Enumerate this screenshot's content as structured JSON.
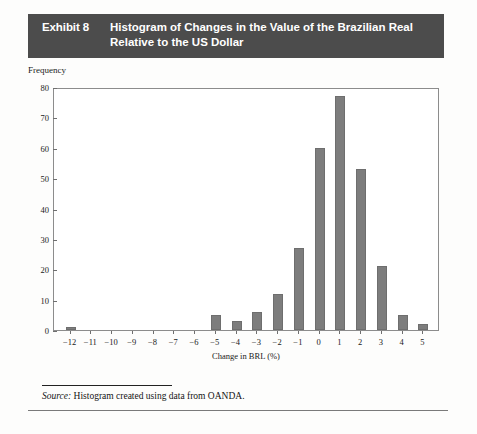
{
  "exhibit": {
    "number_label": "Exhibit 8",
    "title": "Histogram of Changes in the Value of the Brazilian Real Relative to the US Dollar",
    "title_line1": "Histogram of Changes in the Value of the Brazilian Real",
    "title_line2": "Relative to the US Dollar",
    "banner_color": "#4c4c4c",
    "banner_text_color": "#ffffff"
  },
  "source": {
    "label": "Source:",
    "text": "Histogram created using data from OANDA."
  },
  "chart_data": {
    "type": "bar",
    "title": "Histogram of Changes in the Value of the Brazilian Real Relative to the US Dollar",
    "subtitle": "",
    "xlabel": "Change in BRL (%)",
    "ylabel": "Frequency",
    "categories": [
      "-12",
      "-11",
      "-10",
      "-9",
      "-8",
      "-7",
      "-6",
      "-5",
      "-4",
      "-3",
      "-2",
      "-1",
      "0",
      "1",
      "2",
      "3",
      "4",
      "5"
    ],
    "values": [
      1,
      0,
      0,
      0,
      0,
      0,
      0,
      5,
      3,
      6,
      12,
      27,
      60,
      77,
      53,
      21,
      5,
      2
    ],
    "xlim": [
      -12.8,
      5.8
    ],
    "ylim": [
      0,
      80
    ],
    "ytick_labels": [
      "80",
      "70",
      "60",
      "50",
      "40",
      "30",
      "20",
      "10",
      "0"
    ],
    "ytick_values": [
      80,
      70,
      60,
      50,
      40,
      30,
      20,
      10,
      0
    ],
    "xtick_labels": [
      "−12",
      "−11",
      "−10",
      "−9",
      "−8",
      "−7",
      "−6",
      "−5",
      "−4",
      "−3",
      "−2",
      "−1",
      "0",
      "1",
      "2",
      "3",
      "4",
      "5"
    ],
    "xtick_values": [
      -12,
      -11,
      -10,
      -9,
      -8,
      -7,
      -6,
      -5,
      -4,
      -3,
      -2,
      -1,
      0,
      1,
      2,
      3,
      4,
      5
    ],
    "grid": false,
    "legend": "none",
    "bar_color": "#7d7d7d",
    "bar_border_color": "#6e6e6e",
    "axis_color": "#8c8c8c"
  }
}
